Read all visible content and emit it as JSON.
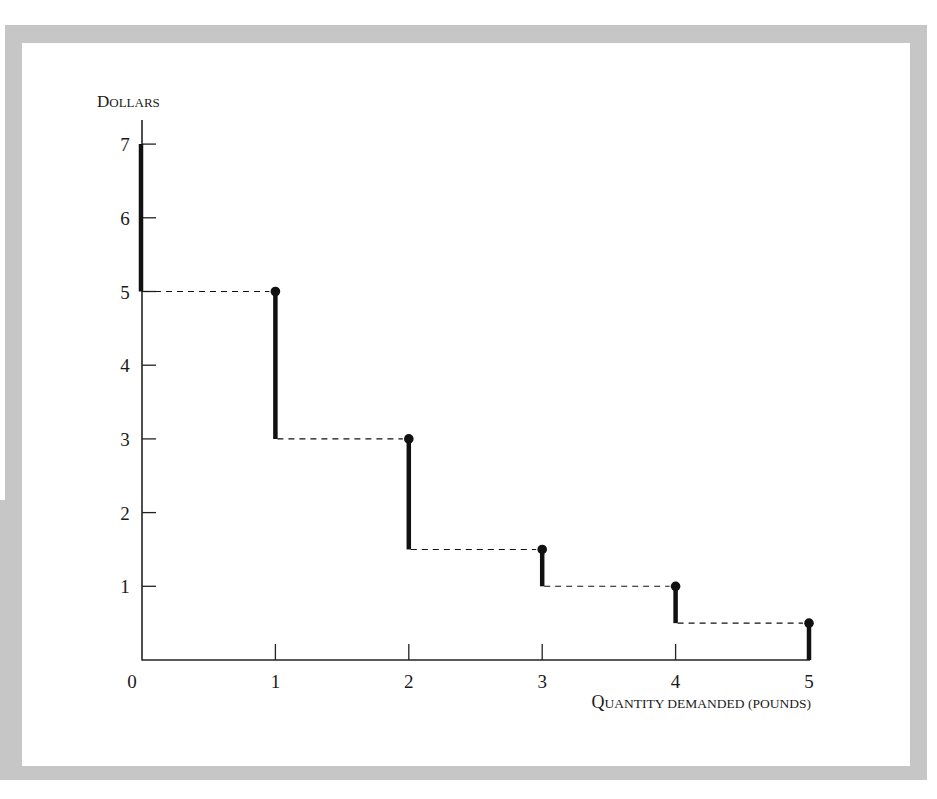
{
  "chart_data": {
    "type": "line",
    "subtype": "step-demand-curve",
    "title": "",
    "xlabel": "Quantity demanded (pounds)",
    "ylabel": "Dollars",
    "xlim": [
      0,
      5
    ],
    "ylim": [
      0,
      7
    ],
    "x_ticks": [
      "0",
      "1",
      "2",
      "3",
      "4",
      "5"
    ],
    "y_ticks": [
      "1",
      "2",
      "3",
      "4",
      "5",
      "6",
      "7"
    ],
    "grid": false,
    "legend": null,
    "steps": [
      {
        "quantity": 0,
        "price_top": 7.0,
        "price_bottom": 5.0,
        "dot": false
      },
      {
        "quantity": 1,
        "price_top": 5.0,
        "price_bottom": 3.0,
        "dot": true
      },
      {
        "quantity": 2,
        "price_top": 3.0,
        "price_bottom": 1.5,
        "dot": true
      },
      {
        "quantity": 3,
        "price_top": 1.5,
        "price_bottom": 1.0,
        "dot": true
      },
      {
        "quantity": 4,
        "price_top": 1.0,
        "price_bottom": 0.5,
        "dot": true
      },
      {
        "quantity": 5,
        "price_top": 0.5,
        "price_bottom": 0.0,
        "dot": true
      }
    ],
    "series": [
      {
        "name": "Willingness to pay (step demand)",
        "x": [
          0,
          1,
          2,
          3,
          4,
          5
        ],
        "values": [
          5.0,
          3.0,
          1.5,
          1.0,
          0.5,
          0.0
        ]
      }
    ],
    "colors": {
      "line": "#111111",
      "axis": "#222222",
      "frame": "#c6c6c6"
    }
  },
  "labels": {
    "y_axis_title": "Dollars",
    "x_axis_title": "Quantity demanded (pounds)",
    "origin": "0"
  }
}
